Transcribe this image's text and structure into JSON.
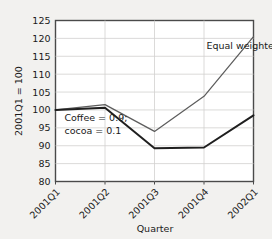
{
  "chart_data": {
    "type": "line",
    "title": "",
    "xlabel": "Quarter",
    "ylabel": "2001Q1 = 100",
    "categories": [
      "2001Q1",
      "2001Q2",
      "2001Q3",
      "2001Q4",
      "2002Q1"
    ],
    "ylim": [
      80,
      125
    ],
    "yticks": [
      80,
      85,
      90,
      95,
      100,
      105,
      110,
      115,
      120,
      125
    ],
    "ytick_labels": [
      "80",
      "85",
      "90",
      "95",
      "100",
      "105",
      "110",
      "115",
      "120",
      "125"
    ],
    "grid": true,
    "legend_position": "inline-annotation",
    "series": [
      {
        "name": "Equal weighted",
        "values": [
          100.0,
          101.5,
          94.0,
          103.8,
          120.5
        ],
        "color": "#5d5d5d"
      },
      {
        "name": "Coffee = 0.9; cocoa = 0.1",
        "values": [
          100.0,
          100.6,
          89.3,
          89.5,
          98.5
        ],
        "color": "#1f1f1f"
      }
    ],
    "annotations": [
      {
        "text": "Equal weighted",
        "x_value": 3.05,
        "y_value": 117.0
      },
      {
        "text": "Coffee = 0.9;",
        "x_value": 0.18,
        "y_value": 96.8
      },
      {
        "text": "cocoa = 0.1",
        "x_value": 0.18,
        "y_value": 93.4
      }
    ]
  },
  "axes": {
    "y_title": "2001Q1 = 100",
    "x_title": "Quarter"
  },
  "colors": {
    "page_background": "#f2f1ef",
    "plot_background": "#ffffff",
    "plot_border": "#4a4a4a",
    "gridline": "#d2d1cf",
    "equal_weighted_line": "#5d5d5d",
    "coffee_cocoa_line": "#1f1f1f",
    "text": "#1a1a1a"
  }
}
